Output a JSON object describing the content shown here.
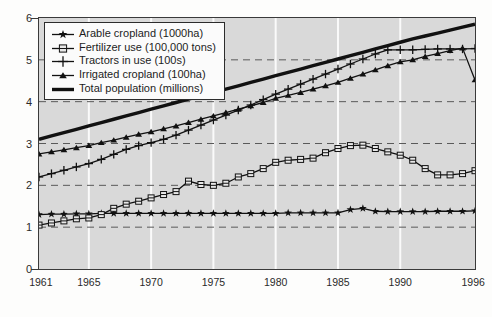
{
  "chart_data": {
    "type": "line",
    "title": "",
    "xlabel": "",
    "ylabel": "",
    "xlim": [
      1961,
      1996
    ],
    "ylim": [
      0,
      6
    ],
    "yticks": [
      0,
      1,
      2,
      3,
      4,
      5,
      6
    ],
    "xticks": [
      1961,
      1965,
      1970,
      1975,
      1980,
      1985,
      1990,
      1996
    ],
    "grid": "horizontal dashed gridlines at 1,2,3,4,5; vertical white gridlines at 1965,1970,1975,1980,1985,1990",
    "legend_position": "top-left inside plot",
    "plot_background": "#d9d9d9",
    "x": [
      1961,
      1962,
      1963,
      1964,
      1965,
      1966,
      1967,
      1968,
      1969,
      1970,
      1971,
      1972,
      1973,
      1974,
      1975,
      1976,
      1977,
      1978,
      1979,
      1980,
      1981,
      1982,
      1983,
      1984,
      1985,
      1986,
      1987,
      1988,
      1989,
      1990,
      1991,
      1992,
      1993,
      1994,
      1995,
      1996
    ],
    "series": [
      {
        "name": "Arable cropland (1000ha)",
        "marker": "star",
        "color": "#111111",
        "values": [
          1.3,
          1.31,
          1.31,
          1.32,
          1.32,
          1.33,
          1.33,
          1.33,
          1.33,
          1.33,
          1.33,
          1.33,
          1.33,
          1.33,
          1.33,
          1.33,
          1.33,
          1.33,
          1.33,
          1.33,
          1.34,
          1.34,
          1.34,
          1.34,
          1.34,
          1.42,
          1.45,
          1.38,
          1.37,
          1.37,
          1.37,
          1.37,
          1.38,
          1.38,
          1.38,
          1.39
        ]
      },
      {
        "name": "Fertilizer use (100,000 tons)",
        "marker": "square",
        "color": "#111111",
        "values": [
          1.05,
          1.1,
          1.15,
          1.2,
          1.22,
          1.3,
          1.45,
          1.55,
          1.62,
          1.7,
          1.78,
          1.85,
          2.1,
          2.02,
          2.0,
          2.05,
          2.2,
          2.28,
          2.4,
          2.55,
          2.6,
          2.62,
          2.65,
          2.78,
          2.88,
          2.95,
          2.96,
          2.88,
          2.8,
          2.72,
          2.6,
          2.4,
          2.25,
          2.25,
          2.28,
          2.35
        ]
      },
      {
        "name": "Tractors in use (100s)",
        "marker": "plus",
        "color": "#111111",
        "values": [
          2.2,
          2.28,
          2.36,
          2.44,
          2.52,
          2.62,
          2.74,
          2.86,
          2.95,
          3.02,
          3.1,
          3.2,
          3.32,
          3.44,
          3.56,
          3.68,
          3.8,
          3.92,
          4.05,
          4.18,
          4.3,
          4.42,
          4.54,
          4.66,
          4.78,
          4.9,
          5.02,
          5.14,
          5.24,
          5.24,
          5.24,
          5.25,
          5.26,
          5.26,
          5.26,
          5.27
        ]
      },
      {
        "name": "Irrigated cropland (100ha)",
        "marker": "triangle",
        "color": "#111111",
        "values": [
          2.75,
          2.8,
          2.85,
          2.9,
          2.95,
          3.02,
          3.08,
          3.15,
          3.22,
          3.28,
          3.35,
          3.42,
          3.5,
          3.58,
          3.66,
          3.74,
          3.82,
          3.9,
          3.98,
          4.08,
          4.15,
          4.22,
          4.3,
          4.38,
          4.46,
          4.56,
          4.66,
          4.76,
          4.86,
          4.95,
          5.0,
          5.08,
          5.15,
          5.22,
          5.28,
          4.52
        ]
      },
      {
        "name": "Total population (millions)",
        "marker": "thick-line",
        "color": "#111111",
        "values": [
          3.1,
          3.18,
          3.26,
          3.34,
          3.42,
          3.5,
          3.58,
          3.66,
          3.74,
          3.82,
          3.9,
          3.98,
          4.06,
          4.14,
          4.22,
          4.3,
          4.38,
          4.46,
          4.54,
          4.62,
          4.7,
          4.78,
          4.86,
          4.94,
          5.02,
          5.1,
          5.18,
          5.26,
          5.34,
          5.42,
          5.5,
          5.57,
          5.64,
          5.71,
          5.78,
          5.85
        ]
      }
    ]
  },
  "axes": {
    "ytick_labels": [
      "0",
      "1",
      "2",
      "3",
      "4",
      "5",
      "6"
    ],
    "xtick_labels": [
      "1961",
      "1965",
      "1970",
      "1975",
      "1980",
      "1985",
      "1990",
      "1996"
    ]
  },
  "legend": {
    "items": [
      {
        "label": "Arable cropland (1000ha)",
        "marker": "star"
      },
      {
        "label": "Fertilizer use (100,000 tons)",
        "marker": "square"
      },
      {
        "label": "Tractors in use (100s)",
        "marker": "plus"
      },
      {
        "label": "Irrigated cropland (100ha)",
        "marker": "triangle"
      },
      {
        "label": "Total population (millions)",
        "marker": "thick-line"
      }
    ]
  }
}
